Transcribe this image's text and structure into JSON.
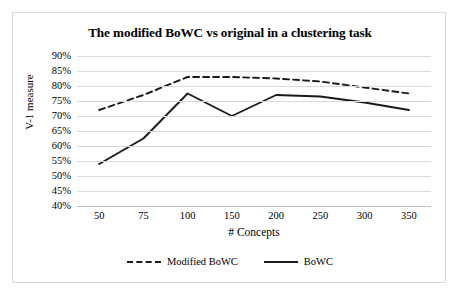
{
  "chart_data": {
    "type": "line",
    "title": "The modified BoWC vs original in a clustering task",
    "xlabel": "# Concepts",
    "ylabel": "V-1 measure",
    "categories": [
      "50",
      "75",
      "100",
      "150",
      "200",
      "250",
      "300",
      "350"
    ],
    "ytick_labels": [
      "90%",
      "85%",
      "80%",
      "75%",
      "70%",
      "65%",
      "60%",
      "55%",
      "50%",
      "45%",
      "40%"
    ],
    "ytick_values": [
      90,
      85,
      80,
      75,
      70,
      65,
      60,
      55,
      50,
      45,
      40
    ],
    "ylim": [
      40,
      90
    ],
    "grid": "horizontal",
    "legend_position": "bottom",
    "series": [
      {
        "name": "Modified BoWC",
        "style": "dashed",
        "color": "#1a1a1a",
        "values": [
          72,
          77,
          83,
          83,
          82.5,
          81.5,
          79.5,
          77.5
        ]
      },
      {
        "name": "BoWC",
        "style": "solid",
        "color": "#1a1a1a",
        "values": [
          54,
          62.5,
          77.5,
          70,
          77,
          76.5,
          74.5,
          72
        ]
      }
    ]
  },
  "legend": {
    "items": [
      {
        "label": "Modified BoWC",
        "style": "dashed"
      },
      {
        "label": "BoWC",
        "style": "solid"
      }
    ]
  }
}
